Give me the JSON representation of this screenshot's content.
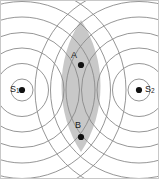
{
  "figure": {
    "width": 159,
    "height": 179,
    "background": "#ffffff",
    "border_color": "#c8c8c8"
  },
  "style": {
    "wavefront_color": "#8a8a8a",
    "wavefront_width": 0.9,
    "shade_fill": "#b5b5b5",
    "shade_opacity": 0.75,
    "dot_color": "#111111",
    "dot_radius": 3.1,
    "label_color": "#1a1a1a"
  },
  "sources": [
    {
      "id": "S1",
      "label": "S",
      "subscript": "1",
      "label_position": "left-of-dot",
      "x": 21,
      "y": 89,
      "wave_count": 7,
      "wave_spacing": 15.5,
      "first_radius": 11
    },
    {
      "id": "S2",
      "label": "S",
      "subscript": "2",
      "label_position": "right-of-dot",
      "x": 138,
      "y": 89,
      "wave_count": 7,
      "wave_spacing": 15.5,
      "first_radius": 11
    }
  ],
  "points": [
    {
      "id": "A",
      "label": "A",
      "x": 80,
      "y": 64,
      "label_offset_x": -10,
      "label_offset_y": -14
    },
    {
      "id": "B",
      "label": "B",
      "x": 80,
      "y": 136,
      "label_offset_x": -6,
      "label_offset_y": -16
    }
  ],
  "shaded_region": {
    "name": "overlap-lens",
    "description": "lens-shaped shaded overlap region between the two wave fields",
    "center_x": 80,
    "top_y": 19,
    "bottom_y": 151,
    "half_width": 26
  },
  "chart_data": {
    "type": "scatter",
    "title": "",
    "xlabel": "",
    "ylabel": "",
    "xlim": [
      0,
      159
    ],
    "ylim": [
      0,
      179
    ],
    "grid": false,
    "legend": "none",
    "annotations": [
      {
        "text": "S1",
        "x": 21,
        "y": 89
      },
      {
        "text": "S2",
        "x": 138,
        "y": 89
      },
      {
        "text": "A",
        "x": 80,
        "y": 64
      },
      {
        "text": "B",
        "x": 80,
        "y": 136
      }
    ],
    "series": [
      {
        "name": "sources",
        "x": [
          21,
          138
        ],
        "y": [
          89,
          89
        ],
        "labels": [
          "S1",
          "S2"
        ]
      },
      {
        "name": "marked-points",
        "x": [
          80,
          80
        ],
        "y": [
          64,
          136
        ],
        "labels": [
          "A",
          "B"
        ]
      }
    ]
  }
}
